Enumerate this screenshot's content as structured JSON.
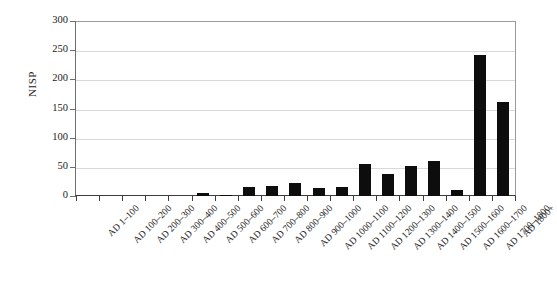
{
  "chart_data": {
    "type": "bar",
    "title": "",
    "xlabel": "",
    "ylabel": "NISP",
    "ylim": [
      0,
      300
    ],
    "ytick_labels": [
      "300",
      "250",
      "200",
      "150",
      "100",
      "50",
      "0"
    ],
    "ytick_values": [
      300,
      250,
      200,
      150,
      100,
      50,
      0
    ],
    "grid": true,
    "legend": "none",
    "bar_color": "#0d0d0d",
    "gridline_color": "#d9d9d9",
    "background_color": "#ffffff",
    "categories": [
      "AD 1–100",
      "AD 100–200",
      "AD 200–300",
      "AD 300–400",
      "AD 400–500",
      "AD 500–600",
      "AD 600–700",
      "AD 700–800",
      "AD 800–900",
      "AD 900–1000",
      "AD 1000–1100",
      "AD 1100–1200",
      "AD 1200–1300",
      "AD 1300–1400",
      "AD 1400–1500",
      "AD 1500–1600",
      "AD 1600–1700",
      "AD 1700–1800",
      "AD 1800+"
    ],
    "values": [
      0,
      0,
      0,
      0,
      0,
      5,
      2,
      15,
      18,
      23,
      13,
      16,
      55,
      38,
      52,
      60,
      11,
      242,
      162
    ]
  }
}
